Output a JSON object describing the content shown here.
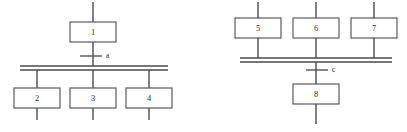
{
  "diagram": {
    "type": "sequential-function-chart",
    "background_color": "#ffffff",
    "line_color": "#4a4a4a",
    "box_fill_color": "#ffffff",
    "text_color": "#2b2b2b",
    "panels": [
      {
        "id": "left-panel",
        "name": "divergence-panel",
        "description": "simultaneous divergence (fork) after transition a",
        "steps": [
          {
            "id": "step-1",
            "label": "1",
            "x": 70,
            "y": 22,
            "w": 46,
            "h": 20,
            "role": "source-step"
          },
          {
            "id": "step-2",
            "label": "2",
            "x": 14,
            "y": 88,
            "w": 46,
            "h": 20,
            "role": "branch-step"
          },
          {
            "id": "step-3",
            "label": "3",
            "x": 70,
            "y": 88,
            "w": 46,
            "h": 20,
            "role": "branch-step"
          },
          {
            "id": "step-4",
            "label": "4",
            "x": 126,
            "y": 88,
            "w": 46,
            "h": 20,
            "role": "branch-step"
          }
        ],
        "transitions": [
          {
            "id": "transition-a",
            "label": "a",
            "tick_x1": 80,
            "tick_x2": 102,
            "tick_y": 56,
            "label_x": 106,
            "label_y": 56
          }
        ],
        "sync_bar": {
          "x1": 20,
          "x2": 168,
          "y_top": 66,
          "y_bottom": 70
        },
        "connectors": [
          {
            "id": "conn-top-stub",
            "x1": 93,
            "y1": 2,
            "x2": 93,
            "y2": 22
          },
          {
            "id": "conn-1-to-a",
            "x1": 93,
            "y1": 42,
            "x2": 93,
            "y2": 66
          },
          {
            "id": "conn-bar-to-2",
            "x1": 37,
            "y1": 70,
            "x2": 37,
            "y2": 88
          },
          {
            "id": "conn-bar-to-3",
            "x1": 93,
            "y1": 70,
            "x2": 93,
            "y2": 88
          },
          {
            "id": "conn-bar-to-4",
            "x1": 149,
            "y1": 70,
            "x2": 149,
            "y2": 88
          },
          {
            "id": "conn-2-stub",
            "x1": 37,
            "y1": 108,
            "x2": 37,
            "y2": 120
          },
          {
            "id": "conn-3-stub",
            "x1": 93,
            "y1": 108,
            "x2": 93,
            "y2": 120
          },
          {
            "id": "conn-4-stub",
            "x1": 149,
            "y1": 108,
            "x2": 149,
            "y2": 120
          }
        ]
      },
      {
        "id": "right-panel",
        "name": "convergence-panel",
        "description": "simultaneous convergence (join) before transition c",
        "steps": [
          {
            "id": "step-5",
            "label": "5",
            "x": 235,
            "y": 18,
            "w": 46,
            "h": 20,
            "role": "branch-step"
          },
          {
            "id": "step-6",
            "label": "6",
            "x": 293,
            "y": 18,
            "w": 46,
            "h": 20,
            "role": "branch-step"
          },
          {
            "id": "step-7",
            "label": "7",
            "x": 351,
            "y": 18,
            "w": 46,
            "h": 20,
            "role": "branch-step"
          },
          {
            "id": "step-8",
            "label": "8",
            "x": 293,
            "y": 84,
            "w": 46,
            "h": 20,
            "role": "target-step"
          }
        ],
        "transitions": [
          {
            "id": "transition-c",
            "label": "c",
            "tick_x1": 306,
            "tick_x2": 328,
            "tick_y": 70,
            "label_x": 332,
            "label_y": 70
          }
        ],
        "sync_bar": {
          "x1": 240,
          "x2": 392,
          "y_top": 58,
          "y_bottom": 62
        },
        "connectors": [
          {
            "id": "conn-5-stub",
            "x1": 258,
            "y1": 2,
            "x2": 258,
            "y2": 18
          },
          {
            "id": "conn-6-stub",
            "x1": 316,
            "y1": 2,
            "x2": 316,
            "y2": 18
          },
          {
            "id": "conn-7-stub",
            "x1": 374,
            "y1": 2,
            "x2": 374,
            "y2": 18
          },
          {
            "id": "conn-5-to-bar",
            "x1": 258,
            "y1": 38,
            "x2": 258,
            "y2": 58
          },
          {
            "id": "conn-6-to-bar",
            "x1": 316,
            "y1": 38,
            "x2": 316,
            "y2": 58
          },
          {
            "id": "conn-7-to-bar",
            "x1": 374,
            "y1": 38,
            "x2": 374,
            "y2": 58
          },
          {
            "id": "conn-bar-to-8",
            "x1": 316,
            "y1": 62,
            "x2": 316,
            "y2": 84
          },
          {
            "id": "conn-8-stub",
            "x1": 316,
            "y1": 104,
            "x2": 316,
            "y2": 124
          }
        ]
      }
    ]
  }
}
